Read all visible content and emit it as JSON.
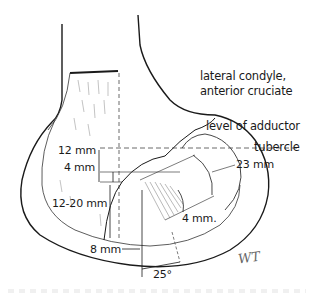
{
  "figure": {
    "labels": {
      "anatomy_line1": "lateral condyle,",
      "anatomy_line2": "anterior cruciate",
      "adductor_line1": "level of adductor",
      "adductor_line2": "tubercle"
    },
    "measurements": {
      "m12": "12 mm",
      "m4_left": "4 mm",
      "m12_20": "12-20 mm",
      "m8": "8 mm",
      "m23": "23 mm",
      "m4_right": "4 mm.",
      "angle": "25°"
    },
    "signature": "WT",
    "colors": {
      "ink": "#1a1a1a",
      "hatch": "#8a8a8a",
      "background": "#ffffff"
    }
  }
}
